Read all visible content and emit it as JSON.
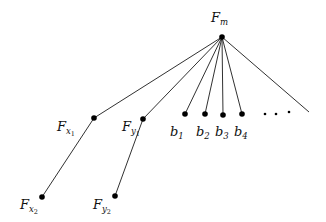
{
  "diagram": {
    "type": "tree",
    "root": {
      "id": "Fm",
      "label": "F",
      "sub": "m",
      "x": 222,
      "y": 37
    },
    "nodes": [
      {
        "id": "Fx1",
        "label": "F",
        "sub": "x",
        "subsub": "1",
        "x": 94,
        "y": 118
      },
      {
        "id": "Fy1",
        "label": "F",
        "sub": "y",
        "subsub": "1",
        "x": 143,
        "y": 119
      },
      {
        "id": "b1",
        "label": "b",
        "sub": "1",
        "x": 185,
        "y": 114
      },
      {
        "id": "b2",
        "label": "b",
        "sub": "2",
        "x": 205,
        "y": 114
      },
      {
        "id": "b3",
        "label": "b",
        "sub": "3",
        "x": 223,
        "y": 115
      },
      {
        "id": "b4",
        "label": "b",
        "sub": "4",
        "x": 242,
        "y": 114
      },
      {
        "id": "Fx2",
        "label": "F",
        "sub": "x",
        "subsub": "2",
        "x": 42,
        "y": 197
      },
      {
        "id": "Fy2",
        "label": "F",
        "sub": "y",
        "subsub": "2",
        "x": 115,
        "y": 196
      }
    ],
    "edges": [
      [
        "Fm",
        "Fx1"
      ],
      [
        "Fm",
        "Fy1"
      ],
      [
        "Fm",
        "b1"
      ],
      [
        "Fm",
        "b2"
      ],
      [
        "Fm",
        "b3"
      ],
      [
        "Fm",
        "b4"
      ],
      [
        "Fm",
        "open-end"
      ],
      [
        "Fx1",
        "Fx2"
      ],
      [
        "Fy1",
        "Fy2"
      ]
    ],
    "ellipsis": "· · ·",
    "labels": {
      "Fm": {
        "base": "F",
        "sub": "m"
      },
      "Fx1": {
        "base": "F",
        "sub": "x",
        "subsub": "1"
      },
      "Fy1": {
        "base": "F",
        "sub": "y",
        "subsub": "1"
      },
      "Fx2": {
        "base": "F",
        "sub": "x",
        "subsub": "2"
      },
      "Fy2": {
        "base": "F",
        "sub": "y",
        "subsub": "2"
      },
      "b1": {
        "base": "b",
        "sub": "1"
      },
      "b2": {
        "base": "b",
        "sub": "2"
      },
      "b3": {
        "base": "b",
        "sub": "3"
      },
      "b4": {
        "base": "b",
        "sub": "4"
      }
    }
  }
}
